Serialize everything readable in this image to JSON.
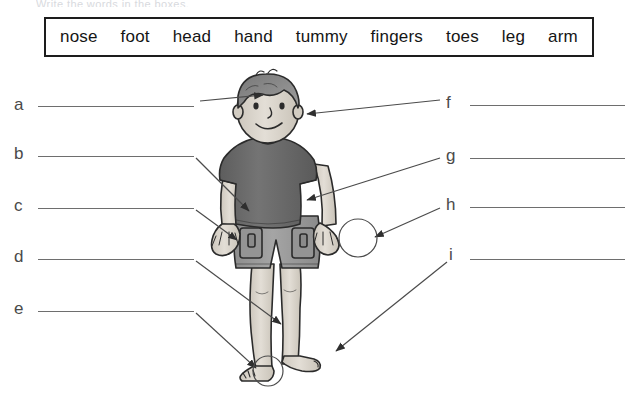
{
  "worksheet": {
    "cropped_top_text": "Write the words in the boxes.",
    "wordbank": {
      "words": [
        "nose",
        "foot",
        "head",
        "hand",
        "tummy",
        "fingers",
        "toes",
        "leg",
        "arm"
      ]
    },
    "answers_left": [
      {
        "letter": "a",
        "value": ""
      },
      {
        "letter": "b",
        "value": ""
      },
      {
        "letter": "c",
        "value": ""
      },
      {
        "letter": "d",
        "value": ""
      },
      {
        "letter": "e",
        "value": ""
      }
    ],
    "answers_right": [
      {
        "letter": "f",
        "value": ""
      },
      {
        "letter": "g",
        "value": ""
      },
      {
        "letter": "h",
        "value": ""
      },
      {
        "letter": "i",
        "value": ""
      }
    ],
    "figure": {
      "description": "cartoon boy standing, grayscale line art",
      "skin_color": "#ded8cf",
      "hair_color": "#8e8e8e",
      "shirt_color": "#6d6d6d",
      "shorts_color": "#9c9c9c",
      "outline_color": "#2b2b2b",
      "callouts": [
        {
          "letter": "a",
          "target": "head"
        },
        {
          "letter": "b",
          "target": "arm"
        },
        {
          "letter": "c",
          "target": "hand"
        },
        {
          "letter": "d",
          "target": "leg"
        },
        {
          "letter": "e",
          "target": "toes"
        },
        {
          "letter": "f",
          "target": "nose"
        },
        {
          "letter": "g",
          "target": "tummy"
        },
        {
          "letter": "h",
          "target": "fingers"
        },
        {
          "letter": "i",
          "target": "foot"
        }
      ],
      "highlight_circles": [
        "fingers",
        "toes"
      ]
    }
  }
}
